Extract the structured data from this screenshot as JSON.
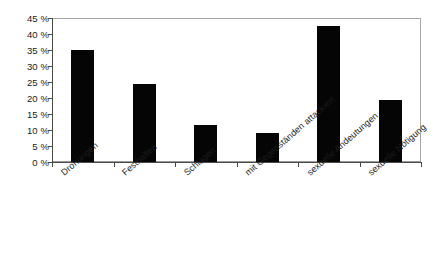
{
  "chart_data": {
    "type": "bar",
    "title": "",
    "subtitle": "",
    "xlabel": "",
    "ylabel": "",
    "ylim": [
      0,
      45
    ],
    "grid": false,
    "legend": "none",
    "orientation": "vertical",
    "bar_color": "#000000",
    "categories": [
      "Drohungen",
      "Festhalten",
      "Schlagen",
      "mit Gegenständen attackiert",
      "sexuelle Andeutungen",
      "sexuelle Nötigung"
    ],
    "values": [
      35,
      24.5,
      11.5,
      9,
      42.5,
      19.5
    ],
    "value_unit": "%",
    "ytick_values": [
      0,
      5,
      10,
      15,
      20,
      25,
      30,
      35,
      40,
      45
    ],
    "ytick_labels": [
      "0 %",
      "5 %",
      "10 %",
      "15 %",
      "20 %",
      "25 %",
      "30 %",
      "35 %",
      "40 %",
      "45 %"
    ]
  },
  "colors": {
    "bar": "#050505",
    "axis": "#4a4a4a",
    "frame": "#9a9a9a",
    "text": "#1a1a1a",
    "background": "#ffffff"
  }
}
